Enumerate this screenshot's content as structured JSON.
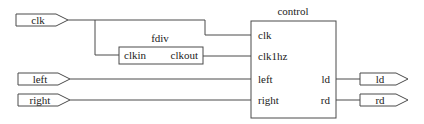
{
  "diagram": {
    "type": "block-schematic",
    "inputs": [
      {
        "id": "clk",
        "label": "clk"
      },
      {
        "id": "left",
        "label": "left"
      },
      {
        "id": "right",
        "label": "right"
      }
    ],
    "outputs": [
      {
        "id": "ld",
        "label": "ld"
      },
      {
        "id": "rd",
        "label": "rd"
      }
    ],
    "modules": {
      "fdiv": {
        "title": "fdiv",
        "ports_in": [
          "clkin"
        ],
        "ports_out": [
          "clkout"
        ]
      },
      "control": {
        "title": "control",
        "ports_in": [
          "clk",
          "clk1hz",
          "left",
          "right"
        ],
        "ports_out": [
          "ld",
          "rd"
        ]
      }
    },
    "connections": [
      {
        "from": "clk",
        "to": "control.clk"
      },
      {
        "from": "clk",
        "to": "fdiv.clkin"
      },
      {
        "from": "fdiv.clkout",
        "to": "control.clk1hz"
      },
      {
        "from": "left",
        "to": "control.left"
      },
      {
        "from": "right",
        "to": "control.right"
      },
      {
        "from": "control.ld",
        "to": "ld"
      },
      {
        "from": "control.rd",
        "to": "rd"
      }
    ]
  }
}
